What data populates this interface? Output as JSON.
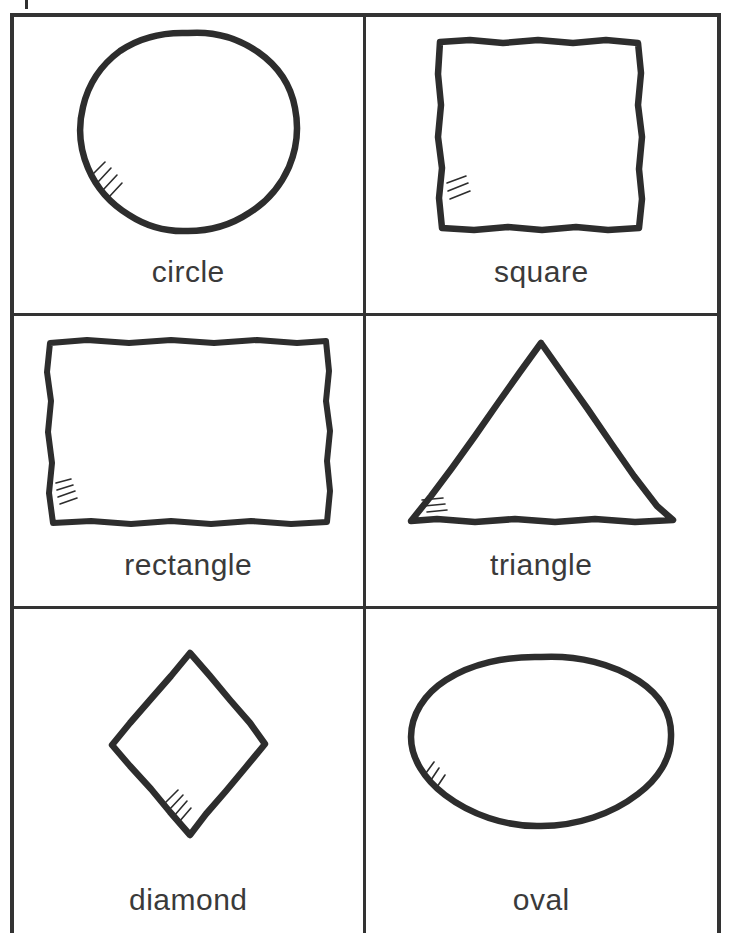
{
  "page": {
    "background_color": "#ffffff",
    "ink_color": "#2d2d2d",
    "rule_color": "#333333",
    "columns": 2,
    "rows": 3,
    "registration_tick": "registration-tick"
  },
  "cards": [
    {
      "id": "circle",
      "label": "circle",
      "shape_icon": "circle-shape-icon",
      "hatch_marks": 4,
      "hatch_position": "lower-left",
      "row": 1,
      "column": 1
    },
    {
      "id": "square",
      "label": "square",
      "shape_icon": "square-shape-icon",
      "hatch_marks": 3,
      "hatch_position": "lower-left",
      "row": 1,
      "column": 2
    },
    {
      "id": "rectangle",
      "label": "rectangle",
      "shape_icon": "rectangle-shape-icon",
      "hatch_marks": 4,
      "hatch_position": "lower-left",
      "row": 2,
      "column": 1
    },
    {
      "id": "triangle",
      "label": "triangle",
      "shape_icon": "triangle-shape-icon",
      "hatch_marks": 3,
      "hatch_position": "lower-left",
      "row": 2,
      "column": 2
    },
    {
      "id": "diamond",
      "label": "diamond",
      "shape_icon": "diamond-shape-icon",
      "hatch_marks": 4,
      "hatch_position": "lower-left",
      "row": 3,
      "column": 1
    },
    {
      "id": "oval",
      "label": "oval",
      "shape_icon": "oval-shape-icon",
      "hatch_marks": 3,
      "hatch_position": "lower-left",
      "row": 3,
      "column": 2
    }
  ]
}
